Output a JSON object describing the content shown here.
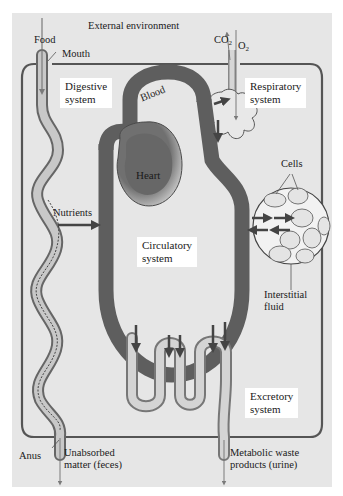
{
  "diagram": {
    "title": "External environment",
    "colors": {
      "panel": "#e6e6e6",
      "body_outline": "#555555",
      "blood_vessel": "#5e5e5e",
      "heart": "#6a6a6a",
      "organ_fill": "#c4c4c4",
      "label_box": "#ffffff",
      "arrow": "#4a4a4a"
    },
    "inputs": {
      "food": "Food",
      "mouth": "Mouth",
      "co2": "CO",
      "co2_sub": "2",
      "o2": "O",
      "o2_sub": "2"
    },
    "systems": {
      "digestive": [
        "Digestive",
        "system"
      ],
      "respiratory": [
        "Respiratory",
        "system"
      ],
      "circulatory": [
        "Circulatory",
        "system"
      ],
      "excretory": [
        "Excretory",
        "system"
      ]
    },
    "structures": {
      "blood": "Blood",
      "heart": "Heart",
      "nutrients": "Nutrients",
      "cells": "Cells",
      "interstitial_fluid": [
        "Interstitial",
        "fluid"
      ]
    },
    "outputs": {
      "anus": "Anus",
      "feces": [
        "Unabsorbed",
        "matter (feces)"
      ],
      "urine": [
        "Metabolic waste",
        "products (urine)"
      ]
    }
  }
}
